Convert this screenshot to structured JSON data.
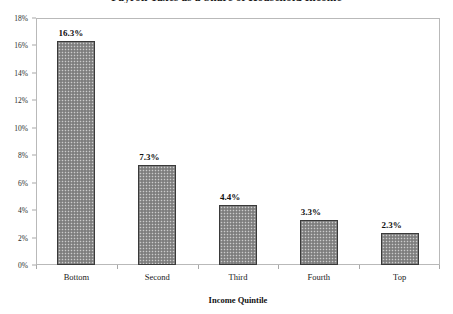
{
  "chart_data": {
    "type": "bar",
    "title": "Payroll Taxes as a Share of Household Income",
    "xlabel": "Income Quintile",
    "ylabel": "",
    "categories": [
      "Bottom",
      "Second",
      "Third",
      "Fourth",
      "Top"
    ],
    "values": [
      16.3,
      7.3,
      4.4,
      3.3,
      2.3
    ],
    "value_labels": [
      "16.3%",
      "7.3%",
      "4.4%",
      "3.3%",
      "2.3%"
    ],
    "ylim": [
      0,
      18
    ],
    "ytick_labels": [
      "18%",
      "16%",
      "14%",
      "12%",
      "10%",
      "8%",
      "6%",
      "4%",
      "2%",
      "0%"
    ],
    "ytick_values": [
      18,
      16,
      14,
      12,
      10,
      8,
      6,
      4,
      2,
      0
    ],
    "grid": false,
    "legend": false,
    "legend_position": "none",
    "units": "percent",
    "bar_fill_color": "#8e8e8e",
    "bar_border_color": "#3a3a3a",
    "axis_color": "#b9b9b9",
    "text_color": "#111111",
    "background_color": "#ffffff"
  }
}
